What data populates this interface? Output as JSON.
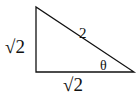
{
  "diagram": {
    "type": "right-triangle",
    "labels": {
      "vertical_leg": "√2",
      "horizontal_leg": "√2",
      "hypotenuse": "2",
      "angle": "θ"
    },
    "vertices": {
      "top_left": [
        36,
        7
      ],
      "bottom_left": [
        36,
        72
      ],
      "bottom_right": [
        134,
        72
      ]
    },
    "stroke_color": "#111111"
  }
}
